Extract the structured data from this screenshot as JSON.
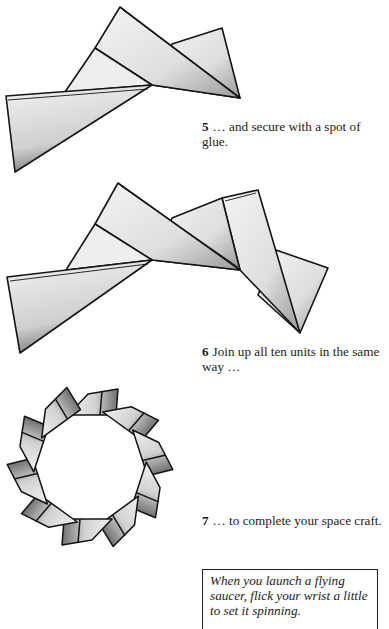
{
  "steps": [
    {
      "number": "5",
      "text": "… and secure with a spot of glue."
    },
    {
      "number": "6",
      "text": "Join up all ten units in the same way …"
    },
    {
      "number": "7",
      "text": "… to complete your space craft."
    }
  ],
  "note": {
    "text": "When you launch a flying saucer, flick your wrist a little to set it spinning."
  },
  "figures": [
    {
      "id": "fig5",
      "description": "two folded triangular paper units glued together"
    },
    {
      "id": "fig6",
      "description": "three folded units joined in a zigzag chain"
    },
    {
      "id": "fig7",
      "description": "ten units joined into a star-shaped ring (flying saucer)"
    }
  ],
  "colors": {
    "paper_fill": "#ececec",
    "paper_shade": "#a8a8a8",
    "outline": "#141414"
  }
}
